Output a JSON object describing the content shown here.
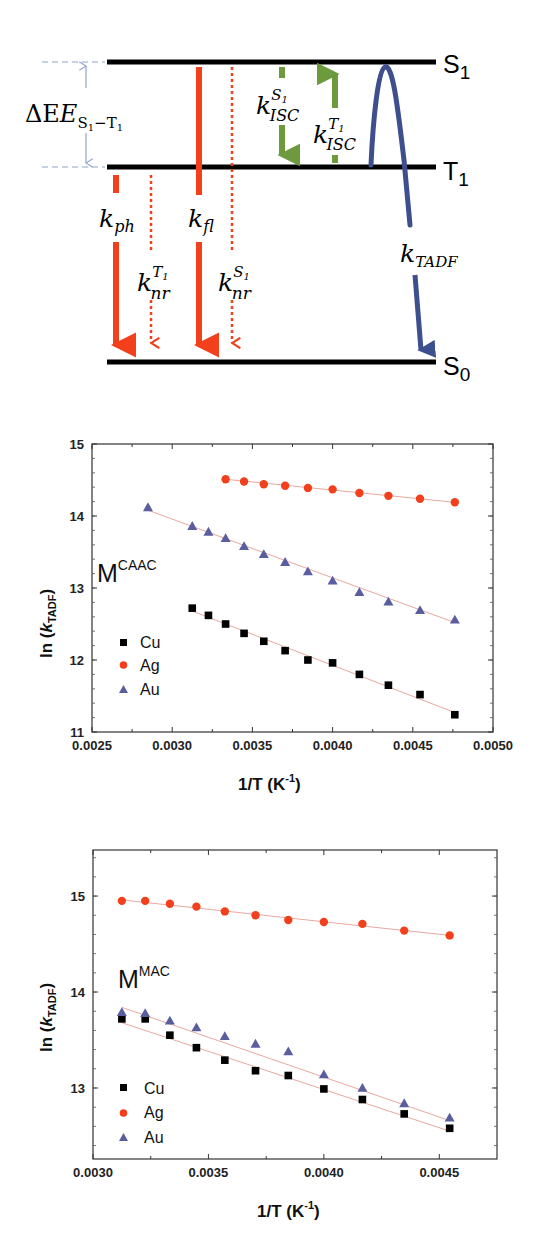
{
  "diagram": {
    "levels": [
      {
        "id": "S1",
        "label": "S",
        "sub": "1",
        "y": 62
      },
      {
        "id": "T1",
        "label": "T",
        "sub": "1",
        "y": 167
      },
      {
        "id": "S0",
        "label": "S",
        "sub": "0",
        "y": 362
      }
    ],
    "energy_gap": {
      "symbol": "ΔE",
      "sub_a": "S",
      "sub_a_idx": "1",
      "dash": "−",
      "sub_b": "T",
      "sub_b_idx": "1"
    },
    "rates": {
      "k_ph": {
        "main": "k",
        "sub": "ph",
        "sup": ""
      },
      "k_nr_T1": {
        "main": "k",
        "sub": "nr",
        "sup": "T",
        "sup_idx": "1"
      },
      "k_fl": {
        "main": "k",
        "sub": "fl",
        "sup": ""
      },
      "k_nr_S1": {
        "main": "k",
        "sub": "nr",
        "sup": "S",
        "sup_idx": "1"
      },
      "k_isc_S1": {
        "main": "k",
        "sub": "ISC",
        "sup": "S",
        "sup_idx": "1"
      },
      "k_isc_T1": {
        "main": "k",
        "sub": "ISC",
        "sup": "T",
        "sup_idx": "1"
      },
      "k_tadf": {
        "main": "k",
        "sub": "TADF",
        "sup": ""
      }
    },
    "colors": {
      "level": "#000000",
      "radiative": "#f2401c",
      "isc": "#6c9a3c",
      "tadf": "#3d4f8f",
      "gap": "#8fa3cc"
    }
  },
  "chart_data": [
    {
      "type": "scatter",
      "title": "",
      "annotation": {
        "base": "M",
        "sup": "CAAC"
      },
      "xlabel": "1/T (K",
      "xlabel_sup": "-1",
      "xlabel_close": ")",
      "ylabel": "ln (",
      "ylabel_k": "k",
      "ylabel_sub": "TADF",
      "ylabel_close": ")",
      "xlim": [
        0.0025,
        0.005
      ],
      "ylim": [
        11,
        15
      ],
      "xticks": [
        "0.0025",
        "0.0030",
        "0.0035",
        "0.0040",
        "0.0045",
        "0.0050"
      ],
      "yticks": [
        "11",
        "12",
        "13",
        "14",
        "15"
      ],
      "legend": [
        "Cu",
        "Ag",
        "Au"
      ],
      "legend_position": "lower-left",
      "grid": false,
      "series": [
        {
          "name": "Cu",
          "marker": "square",
          "color": "#000000",
          "x": [
            0.003125,
            0.003226,
            0.003333,
            0.003448,
            0.003571,
            0.003704,
            0.003846,
            0.004,
            0.004167,
            0.004348,
            0.004545,
            0.004762
          ],
          "y": [
            12.72,
            12.62,
            12.5,
            12.37,
            12.26,
            12.13,
            12.0,
            11.96,
            11.8,
            11.65,
            11.52,
            11.24
          ]
        },
        {
          "name": "Ag",
          "marker": "circle",
          "color": "#f2401c",
          "x": [
            0.003333,
            0.003448,
            0.003571,
            0.003704,
            0.003846,
            0.004,
            0.004167,
            0.004348,
            0.004545,
            0.004762
          ],
          "y": [
            14.51,
            14.48,
            14.44,
            14.42,
            14.39,
            14.37,
            14.32,
            14.28,
            14.24,
            14.19
          ]
        },
        {
          "name": "Au",
          "marker": "triangle",
          "color": "#5a5e9e",
          "x": [
            0.002849,
            0.003125,
            0.003226,
            0.003333,
            0.003448,
            0.003571,
            0.003704,
            0.003846,
            0.004,
            0.004167,
            0.004348,
            0.004545,
            0.004762
          ],
          "y": [
            14.12,
            13.86,
            13.78,
            13.69,
            13.58,
            13.47,
            13.36,
            13.23,
            13.1,
            12.94,
            12.81,
            12.69,
            12.56
          ]
        }
      ],
      "fits": [
        {
          "name": "Cu",
          "x": [
            0.003125,
            0.004762
          ],
          "y": [
            12.68,
            11.27
          ]
        },
        {
          "name": "Ag",
          "x": [
            0.003333,
            0.004762
          ],
          "y": [
            14.51,
            14.19
          ]
        },
        {
          "name": "Au",
          "x": [
            0.002849,
            0.004762
          ],
          "y": [
            14.08,
            12.52
          ]
        }
      ]
    },
    {
      "type": "scatter",
      "title": "",
      "annotation": {
        "base": "M",
        "sup": "MAC"
      },
      "xlabel": "1/T (K",
      "xlabel_sup": "-1",
      "xlabel_close": ")",
      "ylabel": "ln (",
      "ylabel_k": "k",
      "ylabel_sub": "TADF",
      "ylabel_close": ")",
      "xlim": [
        0.003,
        0.00475
      ],
      "ylim": [
        12.26,
        15.48
      ],
      "xticks": [
        "0.0030",
        "0.0035",
        "0.0040",
        "0.0045"
      ],
      "yticks": [
        "13",
        "14",
        "15"
      ],
      "legend": [
        "Cu",
        "Ag",
        "Au"
      ],
      "legend_position": "lower-left",
      "grid": false,
      "series": [
        {
          "name": "Cu",
          "marker": "square",
          "color": "#000000",
          "x": [
            0.003125,
            0.003226,
            0.003333,
            0.003448,
            0.003571,
            0.003704,
            0.003846,
            0.004,
            0.004167,
            0.004348,
            0.004545
          ],
          "y": [
            13.72,
            13.72,
            13.55,
            13.42,
            13.29,
            13.18,
            13.13,
            12.99,
            12.88,
            12.73,
            12.58
          ]
        },
        {
          "name": "Ag",
          "marker": "circle",
          "color": "#f2401c",
          "x": [
            0.003125,
            0.003226,
            0.003333,
            0.003448,
            0.003571,
            0.003704,
            0.003846,
            0.004,
            0.004167,
            0.004348,
            0.004545
          ],
          "y": [
            14.95,
            14.95,
            14.92,
            14.89,
            14.84,
            14.8,
            14.75,
            14.73,
            14.71,
            14.64,
            14.59
          ]
        },
        {
          "name": "Au",
          "marker": "triangle",
          "color": "#5a5e9e",
          "x": [
            0.003125,
            0.003226,
            0.003333,
            0.003448,
            0.003571,
            0.003704,
            0.003846,
            0.004,
            0.004167,
            0.004348,
            0.004545
          ],
          "y": [
            13.79,
            13.78,
            13.7,
            13.63,
            13.54,
            13.46,
            13.38,
            13.14,
            13.0,
            12.84,
            12.69
          ]
        }
      ],
      "fits": [
        {
          "name": "Cu",
          "x": [
            0.003125,
            0.004545
          ],
          "y": [
            13.68,
            12.55
          ]
        },
        {
          "name": "Ag",
          "x": [
            0.003125,
            0.004545
          ],
          "y": [
            14.96,
            14.59
          ]
        },
        {
          "name": "Au",
          "x": [
            0.003125,
            0.004545
          ],
          "y": [
            13.84,
            12.66
          ]
        }
      ]
    }
  ]
}
